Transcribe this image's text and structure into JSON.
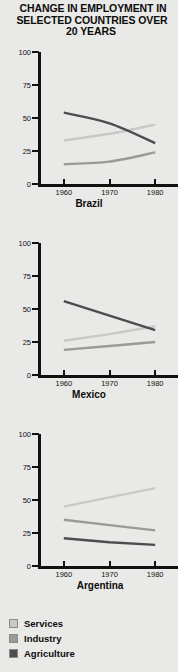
{
  "title": {
    "line1": "CHANGE IN EMPLOYMENT IN",
    "line2": "SELECTED COUNTRIES OVER",
    "line3": "20 YEARS"
  },
  "colors": {
    "services": "#c8c8c6",
    "industry": "#9a9a98",
    "agriculture": "#4d4d4d",
    "axis": "#111111",
    "background": "#e9e9e7"
  },
  "legend": {
    "items": [
      {
        "label": "Services",
        "color": "#c8c8c6"
      },
      {
        "label": "Industry",
        "color": "#9a9a98"
      },
      {
        "label": "Agriculture",
        "color": "#4d4d4d"
      }
    ]
  },
  "axis": {
    "y_ticks": [
      "100",
      "75",
      "50",
      "25",
      "0"
    ],
    "x_ticks": [
      "1960",
      "1970",
      "1980"
    ]
  },
  "chart_data": {
    "type": "line",
    "title": "CHANGE IN EMPLOYMENT IN SELECTED COUNTRIES OVER 20 YEARS",
    "xlabel": "",
    "ylabel": "",
    "x": [
      1960,
      1970,
      1980
    ],
    "xlim": [
      1955,
      1985
    ],
    "ylim": [
      0,
      100
    ],
    "ytick_values": [
      0,
      25,
      50,
      75,
      100
    ],
    "grid": false,
    "legend_position": "bottom-left",
    "units": "percent of employment",
    "panels": [
      {
        "name": "Brazil",
        "curved": true,
        "series": [
          {
            "name": "Services",
            "color": "#c8c8c6",
            "values": [
              33,
              38,
              45
            ]
          },
          {
            "name": "Industry",
            "color": "#9a9a98",
            "values": [
              15,
              17,
              24
            ]
          },
          {
            "name": "Agriculture",
            "color": "#4d4d4d",
            "values": [
              54,
              46,
              31
            ]
          }
        ]
      },
      {
        "name": "Mexico",
        "curved": false,
        "series": [
          {
            "name": "Services",
            "color": "#c8c8c6",
            "values": [
              26,
              31,
              37
            ]
          },
          {
            "name": "Industry",
            "color": "#9a9a98",
            "values": [
              19,
              22,
              25
            ]
          },
          {
            "name": "Agriculture",
            "color": "#4d4d4d",
            "values": [
              56,
              45,
              34
            ]
          }
        ]
      },
      {
        "name": "Argentina",
        "curved": false,
        "series": [
          {
            "name": "Services",
            "color": "#c8c8c6",
            "values": [
              45,
              52,
              59
            ]
          },
          {
            "name": "Industry",
            "color": "#9a9a98",
            "values": [
              35,
              31,
              27
            ]
          },
          {
            "name": "Agriculture",
            "color": "#4d4d4d",
            "values": [
              21,
              18,
              16
            ]
          }
        ]
      }
    ]
  }
}
